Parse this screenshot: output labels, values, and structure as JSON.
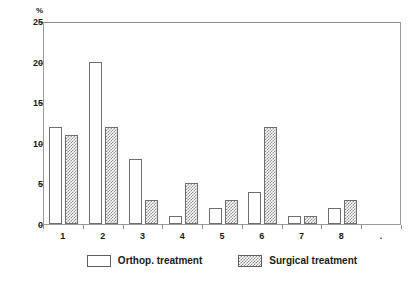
{
  "chart_data": {
    "type": "bar",
    "title": "",
    "subtitle": "",
    "xlabel": "",
    "ylabel": "%",
    "ylim": [
      0,
      25
    ],
    "yticks": [
      0,
      5,
      10,
      15,
      20,
      25
    ],
    "ytick_labels": [
      "0",
      "5",
      "10",
      "15",
      "20",
      "25"
    ],
    "grid": false,
    "legend_position": "bottom",
    "categories": [
      "1",
      "2",
      "3",
      "4",
      "5",
      "6",
      "7",
      "8",
      "."
    ],
    "series": [
      {
        "name": "Orthop. treatment",
        "pattern": "open",
        "values": [
          12,
          20,
          8,
          1,
          2,
          4,
          1,
          2,
          0
        ]
      },
      {
        "name": "Surgical treatment",
        "pattern": "checkered",
        "values": [
          11,
          12,
          3,
          5,
          3,
          12,
          1,
          3,
          0
        ]
      }
    ]
  },
  "axes": {
    "y_unit_label": "%"
  },
  "legend": {
    "entries": [
      {
        "label": "Orthop. treatment",
        "swatch": "open-square-icon"
      },
      {
        "label": "Surgical treatment",
        "swatch": "checkered-square-icon"
      }
    ]
  },
  "colors": {
    "frame": "#9a9a9a",
    "bar_outline": "#6e6e6e",
    "hatch": "#8e8e8e",
    "background": "#ffffff",
    "text": "#1a1a1a"
  }
}
